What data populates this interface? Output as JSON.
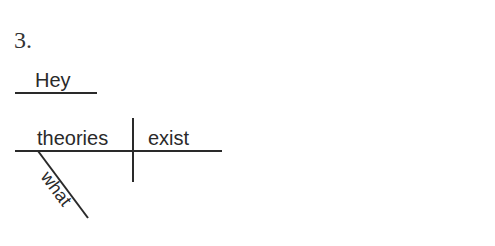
{
  "problem_number": "3.",
  "diagram": {
    "independent_element": "Hey",
    "subject": "theories",
    "verb": "exist",
    "modifiers": [
      {
        "word": "what",
        "modifies": "theories"
      }
    ]
  },
  "colors": {
    "line": "#2a2a2a",
    "text": "#2a2a2a"
  }
}
